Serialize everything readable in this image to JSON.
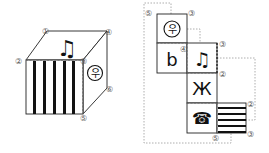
{
  "cube": {
    "vertex_labels": {
      "v1": "①",
      "v2": "②",
      "v3": "③",
      "v4": "④",
      "v5": "⑤",
      "v6": "⑥"
    },
    "faces": {
      "top": "music-note-icon",
      "front": "vertical-stripes",
      "right": "circle-symbol-icon"
    },
    "right_symbol": "우"
  },
  "net": {
    "faces": [
      {
        "id": "f1",
        "symbol": "우",
        "icon": "circle-symbol-icon"
      },
      {
        "id": "f2",
        "symbol": "b",
        "icon": "flat-b-icon"
      },
      {
        "id": "f3",
        "symbol": "♫",
        "icon": "music-note-icon"
      },
      {
        "id": "f4",
        "symbol": "Ж",
        "icon": "zhe-letter-icon"
      },
      {
        "id": "f5",
        "symbol": "☎",
        "icon": "telephone-icon"
      },
      {
        "id": "f6",
        "symbol": "",
        "icon": "horizontal-stripes"
      }
    ],
    "vertex_labels": {
      "a": "⑤",
      "b": "③",
      "c": "④",
      "d": "③",
      "e": "②",
      "f": "②",
      "g": "③",
      "h": "⑤"
    }
  },
  "colors": {
    "line": "#222222",
    "dashed": "#888888",
    "label": "#555555"
  }
}
